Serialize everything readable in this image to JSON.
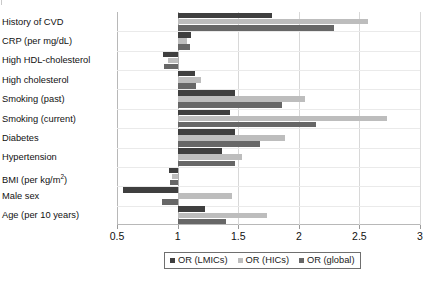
{
  "chart_data": {
    "type": "bar",
    "orientation": "horizontal",
    "title": "",
    "xlabel": "",
    "ylabel": "",
    "xlim": [
      0.5,
      3
    ],
    "reference_line": 1,
    "grid": true,
    "legend_position": "bottom",
    "xticks": [
      0.5,
      1,
      1.5,
      2,
      2.5,
      3
    ],
    "xtick_labels": [
      "0.5",
      "1",
      "1.5",
      "2",
      "2.5",
      "3"
    ],
    "categories": [
      "History of CVD",
      "CRP (per mg/dL)",
      "High HDL-cholesterol",
      "High cholesterol",
      "Smoking (past)",
      "Smoking (current)",
      "Diabetes",
      "Hypertension",
      "BMI (per kg/m²)",
      "Male sex",
      "Age (per 10 years)"
    ],
    "series": [
      {
        "name": "OR (LMICs)",
        "color": "#3f3f3f",
        "values": [
          1.78,
          1.11,
          0.88,
          1.14,
          1.47,
          1.43,
          1.47,
          1.37,
          0.93,
          0.55,
          1.23
        ]
      },
      {
        "name": "OR (HICs)",
        "color": "#bdbdbd",
        "values": [
          2.57,
          1.08,
          0.92,
          1.19,
          2.05,
          2.73,
          1.89,
          1.53,
          0.95,
          1.45,
          1.74
        ]
      },
      {
        "name": "OR (global)",
        "color": "#676767",
        "values": [
          2.29,
          1.1,
          0.89,
          1.15,
          1.86,
          2.14,
          1.68,
          1.47,
          0.94,
          0.87,
          1.4
        ]
      }
    ]
  },
  "legend": {
    "items": [
      {
        "label": "OR (LMICs)",
        "color": "#3f3f3f"
      },
      {
        "label": "OR (HICs)",
        "color": "#bdbdbd"
      },
      {
        "label": "OR (global)",
        "color": "#676767"
      }
    ]
  },
  "axis": {
    "labels": [
      "0.5",
      "1",
      "1.5",
      "2",
      "2.5",
      "3"
    ]
  },
  "categories_display": [
    "History of CVD",
    "CRP (per mg/dL)",
    "High HDL-cholesterol",
    "High cholesterol",
    "Smoking (past)",
    "Smoking (current)",
    "Diabetes",
    "Hypertension",
    "BMI (per kg/m",
    "Male sex",
    "Age (per 10 years)"
  ],
  "bmi_label": {
    "base": "BMI (per kg/m",
    "sup": "2",
    "tail": ")"
  }
}
